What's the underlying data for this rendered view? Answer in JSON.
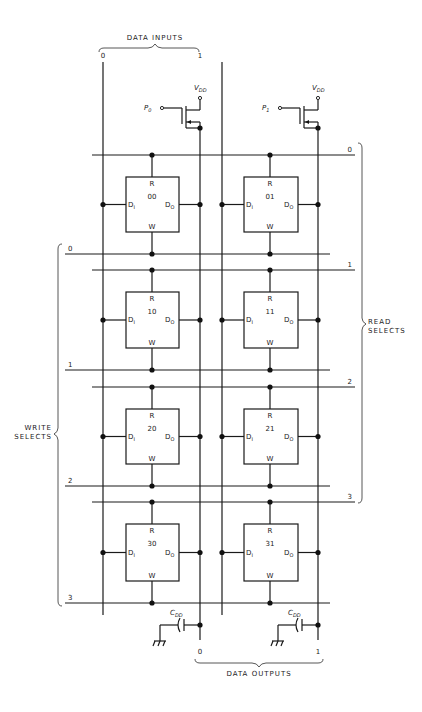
{
  "diagram": {
    "type": "memory-array-schematic",
    "data_inputs": {
      "label": "DATA INPUTS",
      "lines": [
        "0",
        "1"
      ]
    },
    "data_outputs": {
      "label": "DATA OUTPUTS",
      "lines": [
        "0",
        "1"
      ]
    },
    "read_selects": {
      "label_line1": "READ",
      "label_line2": "SELECTS",
      "lines": [
        "0",
        "1",
        "2",
        "3"
      ]
    },
    "write_selects": {
      "label_line1": "WRITE",
      "label_line2": "SELECTS",
      "lines": [
        "0",
        "1",
        "2",
        "3"
      ]
    },
    "precharge": [
      {
        "gate": "P",
        "gate_sub": "0",
        "supply": "V",
        "supply_sub": "DD"
      },
      {
        "gate": "P",
        "gate_sub": "1",
        "supply": "V",
        "supply_sub": "DD"
      }
    ],
    "capacitors": [
      {
        "label": "C",
        "label_sub": "DD"
      },
      {
        "label": "C",
        "label_sub": "DD"
      }
    ],
    "cell_pins": {
      "read": "R",
      "write": "W",
      "in": "D",
      "in_sub": "I",
      "out": "D",
      "out_sub": "O"
    },
    "cells": [
      [
        "00",
        "01"
      ],
      [
        "10",
        "11"
      ],
      [
        "20",
        "21"
      ],
      [
        "30",
        "31"
      ]
    ]
  }
}
